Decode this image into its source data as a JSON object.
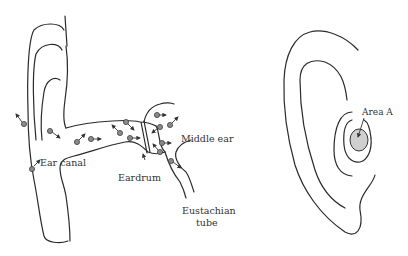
{
  "figure": {
    "left_panel": {
      "title": "Ear cross-section with particles",
      "labels": {
        "ear_canal": "Ear canal",
        "eardrum": "Eardrum",
        "middle_ear": "Middle ear",
        "eustachian_line1": "Eustachian",
        "eustachian_line2": "tube"
      }
    },
    "right_panel": {
      "title": "External ear",
      "labels": {
        "area_a": "Area A"
      },
      "colors": {
        "area_fill": "#cfcfcf"
      }
    },
    "colors": {
      "line": "#2a2a2a",
      "particle": "#8a8a8a",
      "background": "#ffffff"
    }
  }
}
